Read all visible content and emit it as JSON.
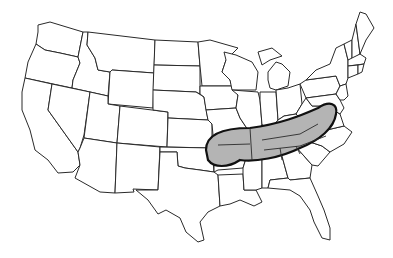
{
  "map": {
    "subject": "Contiguous United States outline map with state borders",
    "highlighted_region": {
      "description": "Shaded band spanning southeastern Oklahoma/Arkansas east through Tennessee, northern Mississippi/Alabama/Georgia, Kentucky south, into western North Carolina and Virginia",
      "fill_color": "#b4b4b4",
      "outline_color": "#111111"
    },
    "colors": {
      "background": "#ffffff",
      "state_border": "#2a2a2a"
    }
  }
}
